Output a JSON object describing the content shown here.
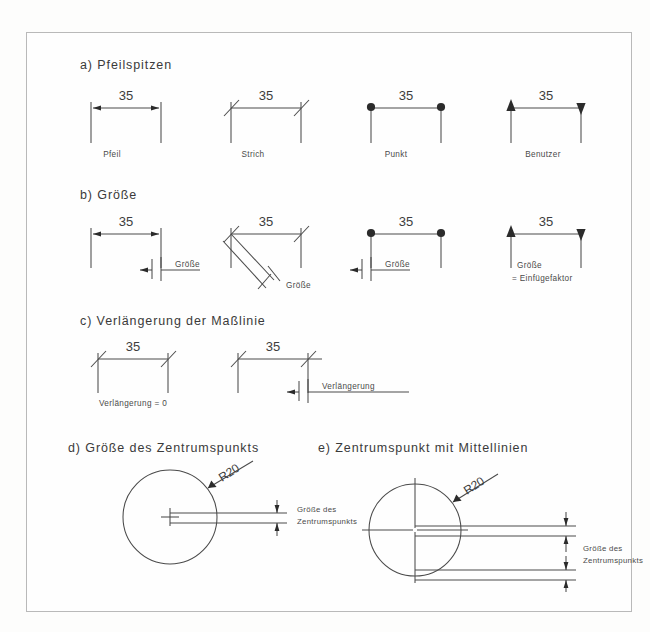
{
  "document": {
    "kind": "technical-drawing-reference-sheet",
    "language": "de",
    "background_color": "#fdfdfc",
    "line_color": "#4a4a4a"
  },
  "sections": {
    "a": {
      "key": "a)",
      "heading": "a) Pfeilspitzen",
      "dimension_value": "35",
      "variants": [
        {
          "caption": "Pfeil",
          "terminator": "arrow"
        },
        {
          "caption": "Strich",
          "terminator": "oblique-stroke"
        },
        {
          "caption": "Punkt",
          "terminator": "filled-dot"
        },
        {
          "caption": "Benutzer",
          "terminator": "filled-triangle"
        }
      ]
    },
    "b": {
      "key": "b)",
      "heading": "b) Größe",
      "dimension_value": "35",
      "callouts": [
        {
          "label": "Größe"
        },
        {
          "label": "Größe"
        },
        {
          "label": "Größe"
        },
        {
          "label": "Größe",
          "label2": "= Einfügefaktor"
        }
      ]
    },
    "c": {
      "key": "c)",
      "heading": "c) Verlängerung der Maßlinie",
      "dimension_value": "35",
      "callouts": [
        {
          "label": "Verlängerung = 0"
        },
        {
          "label": "Verlängerung"
        }
      ]
    },
    "d": {
      "key": "d)",
      "heading": "d) Größe des Zentrumspunkts",
      "radius_label": "R20",
      "callout_line1": "Größe des",
      "callout_line2": "Zentrumspunkts"
    },
    "e": {
      "key": "e)",
      "heading": "e) Zentrumspunkt mit Mittellinien",
      "radius_label": "R20",
      "callout_line1": "Größe des",
      "callout_line2": "Zentrumspunkts"
    }
  }
}
